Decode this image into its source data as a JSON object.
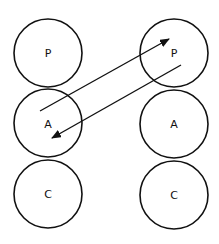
{
  "diagram": {
    "columns": [
      {
        "id": "left",
        "nodes": [
          {
            "label": "P",
            "cx": 48,
            "cy": 53,
            "r": 34
          },
          {
            "label": "A",
            "cx": 48,
            "cy": 123,
            "r": 34
          },
          {
            "label": "C",
            "cx": 48,
            "cy": 194,
            "r": 34
          }
        ]
      },
      {
        "id": "right",
        "nodes": [
          {
            "label": "P",
            "cx": 174,
            "cy": 53,
            "r": 34
          },
          {
            "label": "A",
            "cx": 174,
            "cy": 124,
            "r": 34
          },
          {
            "label": "C",
            "cx": 174,
            "cy": 195,
            "r": 34
          }
        ]
      }
    ],
    "arrows": [
      {
        "from": "left.A",
        "to": "right.P",
        "x1": 40,
        "y1": 111,
        "x2": 169,
        "y2": 39
      },
      {
        "from": "right.P",
        "to": "left.A",
        "x1": 181,
        "y1": 65,
        "x2": 52,
        "y2": 138
      }
    ],
    "stroke_color": "#111111",
    "background": "#ffffff"
  }
}
